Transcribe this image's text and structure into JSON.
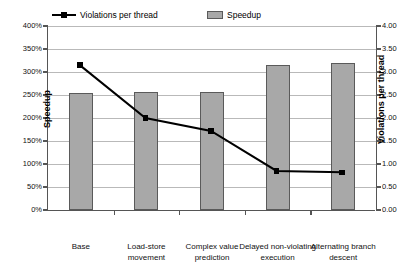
{
  "legend": {
    "items": [
      {
        "label": "Violations per thread",
        "type": "line",
        "color": "#000000"
      },
      {
        "label": "Speedup",
        "type": "bar",
        "color": "#a8a8a8"
      }
    ]
  },
  "axes": {
    "left": {
      "title": "Speedup",
      "ticks": [
        "0%",
        "50%",
        "100%",
        "150%",
        "200%",
        "250%",
        "300%",
        "350%",
        "400%"
      ]
    },
    "right": {
      "title": "Violations per thread",
      "ticks": [
        "0.00",
        "0.50",
        "1.00",
        "1.50",
        "2.00",
        "2.50",
        "3.00",
        "3.50",
        "4.00"
      ]
    },
    "bottom": {
      "categories": [
        "Base",
        "Load-store movement",
        "Complex value prediction",
        "Delayed non-violating execution",
        "Alternating branch descent"
      ]
    }
  },
  "chart_data": {
    "type": "bar",
    "title": "",
    "xlabel": "",
    "ylabel": "Speedup",
    "y2label": "Violations per thread",
    "categories": [
      "Base",
      "Load-store movement",
      "Complex value prediction",
      "Delayed non-violating execution",
      "Alternating branch descent"
    ],
    "ylim": [
      0,
      400
    ],
    "y2lim": [
      0,
      4.0
    ],
    "yticks": [
      0,
      50,
      100,
      150,
      200,
      250,
      300,
      350,
      400
    ],
    "y2ticks": [
      0,
      0.5,
      1.0,
      1.5,
      2.0,
      2.5,
      3.0,
      3.5,
      4.0
    ],
    "grid": true,
    "legend_position": "top",
    "series": [
      {
        "name": "Speedup",
        "type": "bar",
        "axis": "left",
        "unit": "%",
        "color": "#a8a8a8",
        "values": [
          255,
          257,
          257,
          315,
          320
        ]
      },
      {
        "name": "Violations per thread",
        "type": "line",
        "axis": "right",
        "color": "#000000",
        "marker": "square",
        "values": [
          3.15,
          2.0,
          1.72,
          0.85,
          0.82
        ]
      }
    ]
  }
}
